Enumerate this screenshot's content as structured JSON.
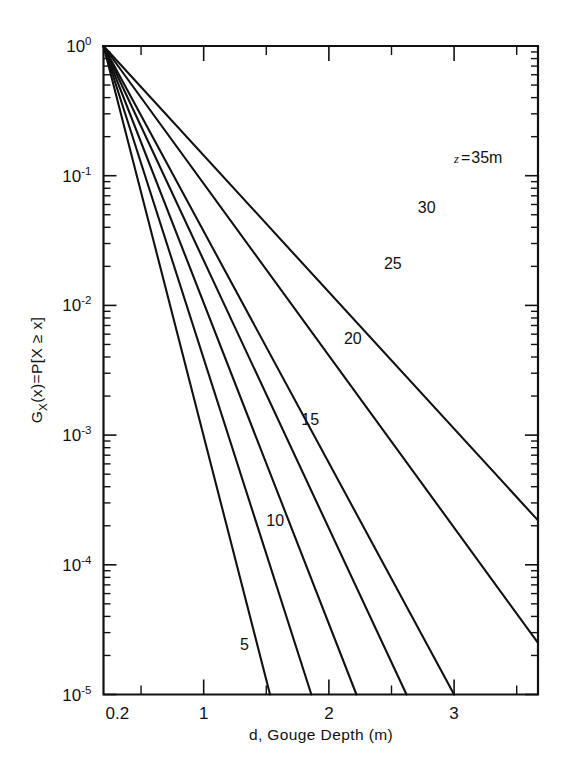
{
  "chart_data": {
    "type": "line",
    "title": "",
    "subtitle": "",
    "xlabel": "d, Gouge Depth (m)",
    "ylabel": "G_X(x) = P[X ≥ x]",
    "ylabel_parts": {
      "g": "G",
      "g_sub": "X",
      "g_arg": "(x)",
      "equals": "=",
      "p": "P",
      "bracket_open": "[",
      "x_ge_x": "X ≥ x",
      "bracket_close": "]"
    },
    "xscale": "linear",
    "yscale": "log",
    "xlim": [
      0.2,
      3.67
    ],
    "ylim": [
      1e-05,
      1
    ],
    "grid": false,
    "legend": "inline-curve-labels",
    "x_ticks_major": [
      1,
      2,
      3
    ],
    "x_tick_labels": [
      "0.2",
      "1",
      "2",
      "3"
    ],
    "x_tick_label_values": [
      0.2,
      1,
      2,
      3
    ],
    "x_ticks_minor": [
      0.5,
      1.5,
      2.5,
      3.5
    ],
    "y_tick_labels": [
      "10^0",
      "10^-1",
      "10^-2",
      "10^-3",
      "10^-4",
      "10^-5"
    ],
    "y_tick_exponents": [
      "0",
      "-1",
      "-2",
      "-3",
      "-4",
      "-5"
    ],
    "y_tick_values": [
      1,
      0.1,
      0.01,
      0.001,
      0.0001,
      1e-05
    ],
    "series_param_name": "z",
    "series_param_unit": "m",
    "annotation_first_curve": "z = 35m",
    "series": [
      {
        "name": "5",
        "label": "5",
        "z": 5,
        "x_start": 0.2,
        "y_start": 1,
        "x_end": 1.53,
        "y_end": 1e-05,
        "label_x": 1.29,
        "label_y": 2.2e-05
      },
      {
        "name": "10",
        "label": "10",
        "z": 10,
        "x_start": 0.2,
        "y_start": 1,
        "x_end": 1.86,
        "y_end": 1e-05,
        "label_x": 1.5,
        "label_y": 0.0002
      },
      {
        "name": "15",
        "label": "15",
        "z": 15,
        "x_start": 0.2,
        "y_start": 1,
        "x_end": 2.22,
        "y_end": 1e-05,
        "label_x": 1.78,
        "label_y": 0.0012
      },
      {
        "name": "20",
        "label": "20",
        "z": 20,
        "x_start": 0.2,
        "y_start": 1,
        "x_end": 2.62,
        "y_end": 1e-05,
        "label_x": 2.12,
        "label_y": 0.005
      },
      {
        "name": "25",
        "label": "25",
        "z": 25,
        "x_start": 0.2,
        "y_start": 1,
        "x_end": 3.0,
        "y_end": 1e-05,
        "label_x": 2.44,
        "label_y": 0.019
      },
      {
        "name": "30",
        "label": "30",
        "z": 30,
        "x_start": 0.2,
        "y_start": 1,
        "x_end": 3.67,
        "y_end": 2.5e-05,
        "label_x": 2.71,
        "label_y": 0.052
      },
      {
        "name": "35",
        "label": "z = 35m",
        "z": 35,
        "x_start": 0.2,
        "y_start": 1,
        "x_end": 3.67,
        "y_end": 0.00022,
        "label_x": 3.0,
        "label_y": 0.125
      }
    ],
    "colors": {
      "line": "#111111",
      "axis": "#111111",
      "background": "#ffffff"
    }
  },
  "figure": {
    "background": "#ffffff"
  }
}
